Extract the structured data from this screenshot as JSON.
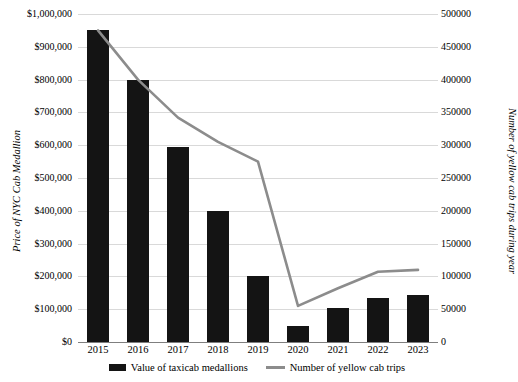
{
  "chart_data": {
    "type": "bar",
    "title": "",
    "subtitle": "",
    "xlabel": "",
    "ylabel": "Price of NYC Cab Medallion",
    "y2label": "Number of yellow cab trips during year",
    "categories": [
      "2015",
      "2016",
      "2017",
      "2018",
      "2019",
      "2020",
      "2021",
      "2022",
      "2023"
    ],
    "grid": true,
    "legend_position": "bottom",
    "ylim": [
      0,
      1000000
    ],
    "y2lim": [
      0,
      500000
    ],
    "y_ticks": [
      "$0",
      "$100,000",
      "$200,000",
      "$300,000",
      "$400,000",
      "$500,000",
      "$600,000",
      "$700,000",
      "$800,000",
      "$900,000",
      "$1,000,000"
    ],
    "y_tick_values": [
      0,
      100000,
      200000,
      300000,
      400000,
      500000,
      600000,
      700000,
      800000,
      900000,
      1000000
    ],
    "y2_ticks": [
      "0",
      "50000",
      "100000",
      "150000",
      "200000",
      "250000",
      "300000",
      "350000",
      "400000",
      "450000",
      "500000"
    ],
    "y2_tick_values": [
      0,
      50000,
      100000,
      150000,
      200000,
      250000,
      300000,
      350000,
      400000,
      450000,
      500000
    ],
    "series": [
      {
        "name": "Value of taxicab medallions",
        "type": "bar",
        "axis": "left",
        "color": "#141414",
        "values": [
          950000,
          800000,
          595000,
          400000,
          200000,
          50000,
          105000,
          135000,
          142000
        ]
      },
      {
        "name": "Number of yellow cab trips",
        "type": "line",
        "axis": "right",
        "color": "#8c8c8c",
        "values": [
          475000,
          400000,
          342000,
          305000,
          275000,
          55000,
          82000,
          107000,
          110000
        ]
      }
    ]
  },
  "legend": {
    "items": [
      {
        "label": "Value of taxicab medallions",
        "marker": "bar-swatch"
      },
      {
        "label": "Number of yellow cab trips",
        "marker": "line-swatch"
      }
    ]
  },
  "colors": {
    "bar": "#141414",
    "line": "#8c8c8c",
    "gridline": "#d9d9d9",
    "axis": "#7f7f7f",
    "background": "#ffffff",
    "text": "#000000"
  }
}
